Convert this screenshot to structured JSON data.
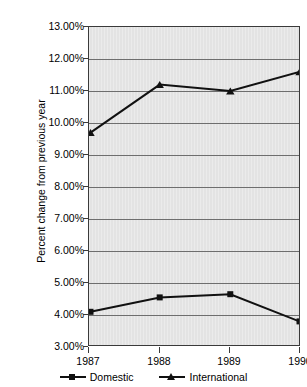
{
  "title_sliver": "PASSENGER TRAFFIC",
  "chart_data": {
    "type": "line",
    "title": "",
    "xlabel": "",
    "ylabel": "Percent change from previous year",
    "categories": [
      "1987",
      "1988",
      "1989",
      "1990"
    ],
    "x": [
      1987,
      1988,
      1989,
      1990
    ],
    "ylim": [
      3.0,
      13.0
    ],
    "ytick_values": [
      13.0,
      12.0,
      11.0,
      10.0,
      9.0,
      8.0,
      7.0,
      6.0,
      5.0,
      4.0,
      3.0
    ],
    "ytick_labels": [
      "13.00%",
      "12.00%",
      "11.00%",
      "10.00%",
      "9.00%",
      "8.00%",
      "7.00%",
      "6.00%",
      "5.00%",
      "4.00%",
      "3.00%"
    ],
    "grid": true,
    "legend_position": "bottom-center",
    "series": [
      {
        "name": "Domestic",
        "marker": "square",
        "color": "#111111",
        "values": [
          4.1,
          4.55,
          4.65,
          3.8
        ]
      },
      {
        "name": "International",
        "marker": "triangle",
        "color": "#111111",
        "values": [
          9.7,
          11.2,
          11.0,
          11.6
        ]
      }
    ]
  },
  "legend": {
    "entries": [
      {
        "label": "Domestic",
        "marker": "square-marker"
      },
      {
        "label": "International",
        "marker": "triangle-marker"
      }
    ]
  },
  "colors": {
    "plot_background": "#e3e3e3",
    "gridline": "#6e6e6e",
    "axis": "#3a3a3a",
    "series": "#111111",
    "page_background": "#ffffff"
  }
}
